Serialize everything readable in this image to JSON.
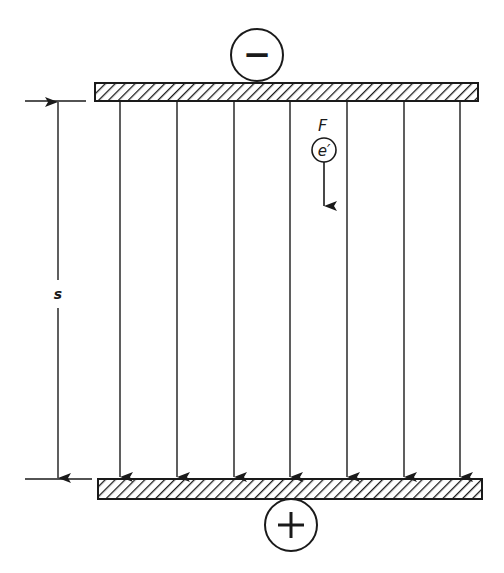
{
  "diagram": {
    "colors": {
      "ink": "#1a1a1a",
      "background": "#ffffff"
    },
    "top_plate": {
      "charge_symbol": "−",
      "polarity": "negative"
    },
    "bottom_plate": {
      "charge_symbol": "+",
      "polarity": "positive"
    },
    "field_lines": {
      "count": 7,
      "direction": "downward",
      "x_positions": [
        120,
        177,
        234,
        290,
        347,
        404,
        460
      ]
    },
    "separation_label": "s",
    "force_label": "F",
    "charge_label": "e′"
  }
}
